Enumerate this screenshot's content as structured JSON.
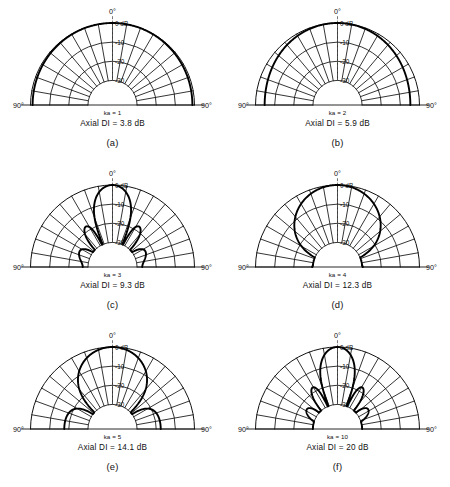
{
  "figure": {
    "background_color": "#ffffff",
    "line_color": "#000000",
    "grid_color": "#1a1a1a",
    "columns": 2,
    "rows": 3
  },
  "axis": {
    "top_angle_label": "0°",
    "left_angle_label": "90°",
    "right_angle_label": "90°",
    "radial_tick_labels": [
      "0 dB",
      "-10",
      "-20",
      "-30"
    ],
    "radial_tick_values_db": [
      0,
      -10,
      -20,
      -30
    ],
    "angular_grid_step_deg": 10,
    "angular_range_deg": [
      -90,
      90
    ],
    "radial_min_db": -30,
    "radial_max_db": 0
  },
  "chart_data": {
    "type": "line",
    "xlabel": "Angle (degrees)",
    "ylabel": "Relative level (dB)",
    "ylim": [
      -30,
      0
    ],
    "xlim": [
      -90,
      90
    ],
    "grid": true,
    "legend_position": "none",
    "projection": "polar-half",
    "panels": [
      {
        "index": "(a)",
        "ka_label": "ka = 1",
        "ka_value": 1,
        "di_label": "Axial DI = 3.8 dB",
        "di_value_db": 3.8,
        "angles_deg": [
          0,
          10,
          20,
          30,
          40,
          50,
          60,
          70,
          80,
          90
        ],
        "levels_db": [
          0,
          -0.1,
          -0.4,
          -0.9,
          -1.5,
          -2.2,
          -2.9,
          -3.4,
          -3.8,
          -3.9
        ]
      },
      {
        "index": "(b)",
        "ka_label": "ka = 2",
        "ka_value": 2,
        "di_label": "Axial DI = 5.9 dB",
        "di_value_db": 5.9,
        "angles_deg": [
          0,
          10,
          20,
          30,
          40,
          50,
          60,
          70,
          80,
          90
        ],
        "levels_db": [
          0,
          -0.4,
          -1.5,
          -3.2,
          -5.3,
          -7.5,
          -9.4,
          -10.9,
          -11.7,
          -12.0
        ]
      },
      {
        "index": "(c)",
        "ka_label": "ka = 3",
        "ka_value": 9.3,
        "di_label": "Axial DI = 9.3 dB",
        "di_value_db": 9.3,
        "angles_deg": [
          0,
          10,
          20,
          30,
          40,
          50,
          60,
          70,
          80,
          90
        ],
        "levels_db": [
          0,
          -0.9,
          -3.4,
          -7.3,
          -12.3,
          -18.0,
          -24.0,
          -29.0,
          -30.0,
          -30.0
        ]
      },
      {
        "index": "(d)",
        "ka_label": "ka = 4",
        "ka_value": 4,
        "di_label": "Axial DI = 12.3 dB",
        "di_value_db": 12.3,
        "angles_deg": [
          0,
          10,
          20,
          30,
          40,
          50,
          60,
          70,
          80,
          90
        ],
        "levels_db": [
          0,
          -1.6,
          -6.2,
          -13.6,
          -24.5,
          -30.0,
          -26.0,
          -27.0,
          -30.0,
          -30.0
        ]
      },
      {
        "index": "(e)",
        "ka_label": "ka = 5",
        "ka_value": 5,
        "di_label": "Axial DI = 14.1 dB",
        "di_value_db": 14.1,
        "angles_deg": [
          0,
          10,
          20,
          30,
          40,
          50,
          60,
          70,
          80,
          90
        ],
        "levels_db": [
          0,
          -2.5,
          -10.0,
          -23.0,
          -30.0,
          -22.0,
          -24.0,
          -30.0,
          -23.0,
          -26.0
        ]
      },
      {
        "index": "(f)",
        "ka_label": "ka = 10",
        "ka_value": 10,
        "di_label": "Axial DI = 20 dB",
        "di_value_db": 20,
        "angles_deg": [
          0,
          10,
          20,
          30,
          40,
          50,
          60,
          70,
          80,
          90
        ],
        "levels_db": [
          0,
          -10.0,
          -30.0,
          -21.0,
          -30.0,
          -25.0,
          -30.0,
          -27.0,
          -30.0,
          -30.0
        ]
      }
    ]
  }
}
